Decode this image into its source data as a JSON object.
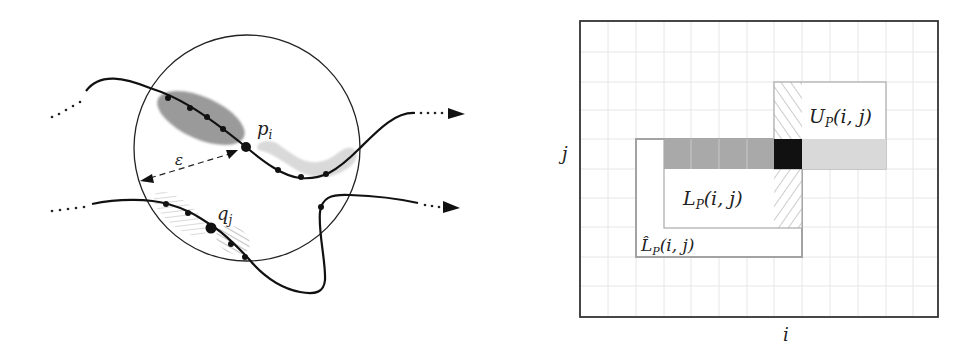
{
  "left_diagram": {
    "circle": {
      "cx": 247,
      "cy": 148,
      "r": 113
    },
    "labels": {
      "p": "p",
      "p_sub": "i",
      "q": "q",
      "q_sub": "j",
      "epsilon": "ε"
    },
    "colors": {
      "stroke": "#111111",
      "dark_region": "#9a9a9a",
      "light_region": "#d6d6d6",
      "hatch": "#bbbbbb"
    }
  },
  "right_diagram": {
    "outer_box": {
      "x": 580,
      "y": 21,
      "w": 358,
      "h": 296
    },
    "grid": {
      "x0": 580,
      "y0": 21,
      "dx": 27.7,
      "dy": 29.4,
      "color": "#e4e4e4"
    },
    "labels": {
      "axis_x": "i",
      "axis_y": "j",
      "U": "U",
      "U_sub": "P",
      "U_args": "(i, j)",
      "L": "L",
      "L_sub": "P",
      "L_args": "(i, j)",
      "Lhat": "L̂",
      "Lhat_sub": "P",
      "Lhat_args": "(i, j)"
    },
    "colors": {
      "box_stroke": "#999999",
      "dark_cell": "#111111",
      "mid_bar": "#a8a8a8",
      "light_bar": "#d8d8d8",
      "hatch": "#aaaaaa"
    }
  }
}
